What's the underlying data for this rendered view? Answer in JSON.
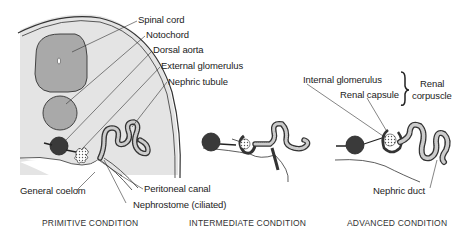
{
  "figure": {
    "colors": {
      "body_fill": "#e4e4e4",
      "organ_fill": "#a9a9a9",
      "dark_vessel": "#3a3a3a",
      "line": "#333333",
      "background": "#ffffff"
    }
  },
  "labels": {
    "spinal_cord": "Spinal cord",
    "notochord": "Notochord",
    "dorsal_aorta": "Dorsal aorta",
    "external_glomerulus": "External glomerulus",
    "nephric_tubule": "Nephric tubule",
    "general_coelom": "General coelom",
    "peritoneal_canal": "Peritoneal canal",
    "nephrostome": "Nephrostome (ciliated)",
    "internal_glomerulus": "Internal glomerulus",
    "renal_capsule": "Renal capsule",
    "renal_corpuscle_line1": "Renal",
    "renal_corpuscle_line2": "corpuscle",
    "nephric_duct": "Nephric duct"
  },
  "captions": {
    "primitive": "PRIMITIVE CONDITION",
    "intermediate": "INTERMEDIATE CONDITION",
    "advanced": "ADVANCED CONDITION"
  }
}
